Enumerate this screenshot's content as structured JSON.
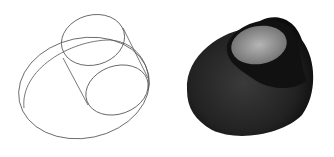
{
  "figure": {
    "panels": [
      {
        "id": "wireframe",
        "description": "wireframe view of intersecting ellipsoid and tilted cylinder",
        "stroke_color": "#555555"
      },
      {
        "id": "shaded",
        "description": "shaded solid view of the same surface",
        "fill_dark": "#1a1a1a",
        "fill_light": "#9a9a9a"
      }
    ]
  }
}
